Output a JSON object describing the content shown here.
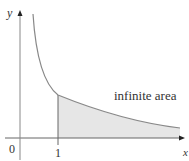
{
  "figure": {
    "y_axis_label": "y",
    "x_axis_label": "x",
    "origin_label": "0",
    "tick_label_1": "1",
    "region_label": "infinite area",
    "curve": "y = 1/x",
    "shaded_from": 1,
    "colors": {
      "axis": "#555555",
      "curve": "#888888",
      "shade": "#e6e6e6"
    }
  }
}
